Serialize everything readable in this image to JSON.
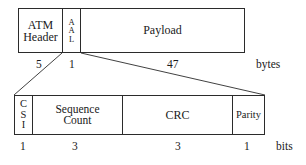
{
  "diagram": {
    "type": "protocol-frame-layout",
    "top_row": {
      "name": "ATM cell structure",
      "fields": [
        {
          "id": "atm_header",
          "label_lines": [
            "ATM",
            "Header"
          ],
          "size": "5"
        },
        {
          "id": "aal",
          "label_lines": [
            "A",
            "A",
            "L"
          ],
          "orientation": "vertical",
          "size": "1"
        },
        {
          "id": "payload",
          "label_lines": [
            "Payload"
          ],
          "size": "47"
        }
      ],
      "unit": "bytes"
    },
    "bottom_row": {
      "name": "AAL1 header byte detail",
      "fields": [
        {
          "id": "csi",
          "label_lines": [
            "C",
            "S",
            "I"
          ],
          "orientation": "vertical",
          "size": "1"
        },
        {
          "id": "sequence_count",
          "label_lines": [
            "Sequence",
            "Count"
          ],
          "size": "3"
        },
        {
          "id": "crc",
          "label_lines": [
            "CRC"
          ],
          "size": "3"
        },
        {
          "id": "parity",
          "label_lines": [
            "Parity"
          ],
          "size": "1"
        }
      ],
      "unit": "bits"
    }
  },
  "colors": {
    "stroke": "#2b2b2b",
    "text": "#1a1a1a",
    "background": "#ffffff"
  }
}
